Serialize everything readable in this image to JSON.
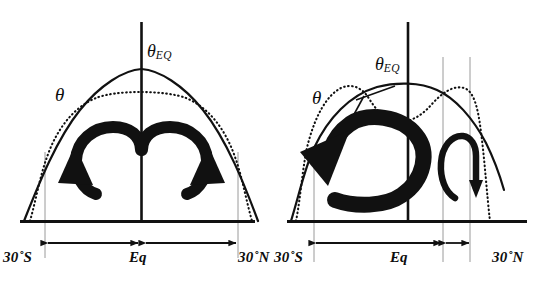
{
  "figure": {
    "type": "diagram",
    "width": 545,
    "height": 282,
    "background": "#ffffff",
    "ink": "#111111",
    "gridline_color": "#9a9a9a"
  },
  "panels": [
    {
      "id": "left",
      "name": "symmetric-case",
      "curves": {
        "theta_eq": {
          "label": "θ",
          "sublabel": "EQ",
          "style": "solid",
          "description": "radiative-equilibrium potential temperature, symmetric dome peaking at the equator"
        },
        "theta": {
          "label": "θ",
          "style": "dotted",
          "description": "actual potential temperature, flattened plateau between the Hadley cell edges"
        }
      },
      "cells": [
        {
          "name": "southern-hadley-cell",
          "sense": "counterclockwise",
          "size": "large"
        },
        {
          "name": "northern-hadley-cell",
          "sense": "clockwise",
          "size": "large"
        }
      ],
      "axis_labels": {
        "left": "30˚S",
        "center": "Eq",
        "right": "30˚N"
      },
      "extent_arrows": [
        {
          "name": "southern-cell-extent",
          "direction": "double"
        },
        {
          "name": "northern-cell-extent",
          "direction": "double"
        }
      ]
    },
    {
      "id": "right",
      "name": "asymmetric-case",
      "curves": {
        "theta_eq": {
          "label": "θ",
          "sublabel": "EQ",
          "style": "solid",
          "description": "radiative-equilibrium potential temperature, peak displaced into the northern hemisphere"
        },
        "theta": {
          "label": "θ",
          "style": "dotted",
          "description": "actual potential temperature, double-humped asymmetric profile"
        }
      },
      "cells": [
        {
          "name": "cross-equatorial-winter-cell",
          "sense": "clockwise",
          "size": "large"
        },
        {
          "name": "summer-cell",
          "sense": "clockwise",
          "size": "small"
        }
      ],
      "axis_labels": {
        "left": "30˚S",
        "center": "Eq",
        "right": "30˚N"
      },
      "extent_arrows": [
        {
          "name": "winter-cell-extent",
          "direction": "double"
        },
        {
          "name": "summer-cell-extent",
          "direction": "double"
        }
      ]
    }
  ]
}
